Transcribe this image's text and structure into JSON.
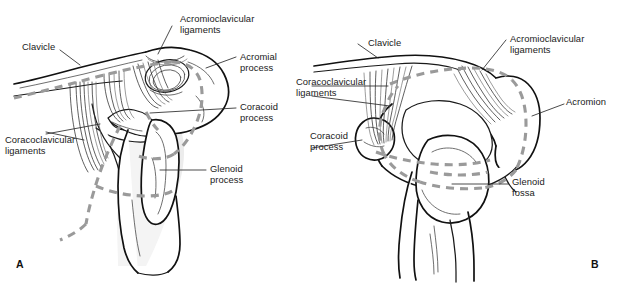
{
  "figure": {
    "background_color": "#ffffff",
    "line_color": "#1a1a1a",
    "dashed_trace_color": "#9a9a9a"
  },
  "panels": [
    {
      "letter": "A",
      "view": "lateral-oblique",
      "labels": [
        {
          "name": "clavicle",
          "text": "Clavicle"
        },
        {
          "name": "acromioclavicular-ligaments",
          "text": "Acromioclavicular\nligaments"
        },
        {
          "name": "acromial-process",
          "text": "Acromial\nprocess"
        },
        {
          "name": "coracoid-process",
          "text": "Coracoid\nprocess"
        },
        {
          "name": "coracoclavicular-ligaments",
          "text": "Coracoclavicular\nligaments"
        },
        {
          "name": "glenoid-process",
          "text": "Glenoid\nprocess"
        }
      ]
    },
    {
      "letter": "B",
      "view": "anterior",
      "labels": [
        {
          "name": "clavicle",
          "text": "Clavicle"
        },
        {
          "name": "acromioclavicular-ligaments",
          "text": "Acromioclavicular\nligaments"
        },
        {
          "name": "coracoclavicular-ligaments",
          "text": "Coracoclavicular\nligaments"
        },
        {
          "name": "coracoid-process",
          "text": "Coracoid\nprocess"
        },
        {
          "name": "acromion",
          "text": "Acromion"
        },
        {
          "name": "glenoid-fossa",
          "text": "Glenoid\nfossa"
        }
      ]
    }
  ]
}
